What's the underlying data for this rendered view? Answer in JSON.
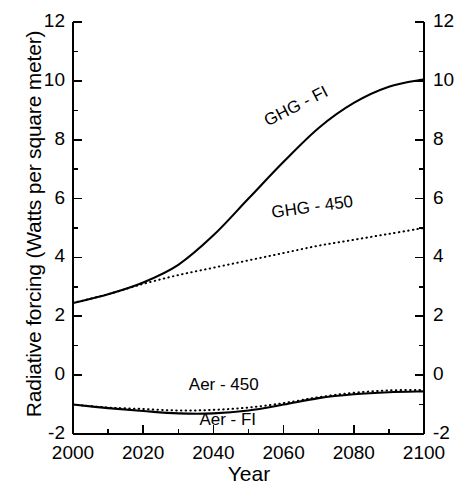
{
  "chart_data": {
    "type": "line",
    "title": "",
    "xlabel": "Year",
    "ylabel": "Radiative forcing (Watts per square meter)",
    "xlim": [
      2000,
      2100
    ],
    "ylim": [
      -2,
      12
    ],
    "xticks": [
      2000,
      2020,
      2040,
      2060,
      2080,
      2100
    ],
    "xtick_labels": [
      "2000",
      "2020",
      "2040",
      "2060",
      "2080",
      "2100"
    ],
    "xtick_minor_step": 10,
    "yticks": [
      -2,
      0,
      2,
      4,
      6,
      8,
      10,
      12
    ],
    "ytick_labels": [
      "-2",
      "0",
      "2",
      "4",
      "6",
      "8",
      "10",
      "12"
    ],
    "ytick_minor_step": 1,
    "grid": false,
    "legend_position": "inline-annotations",
    "mirrored_y_axis": true,
    "x": [
      2000,
      2010,
      2020,
      2030,
      2040,
      2050,
      2060,
      2070,
      2080,
      2090,
      2100
    ],
    "series": [
      {
        "name": "GHG - FI",
        "style": "solid",
        "color": "#000000",
        "values": [
          2.45,
          2.75,
          3.15,
          3.75,
          4.75,
          6.0,
          7.25,
          8.4,
          9.25,
          9.8,
          10.05
        ],
        "label": "GHG - FI",
        "label_x": 2056,
        "label_y": 8.35,
        "label_rotation": -27
      },
      {
        "name": "GHG - 450",
        "style": "dotted",
        "color": "#000000",
        "values": [
          2.45,
          2.75,
          3.1,
          3.4,
          3.65,
          3.9,
          4.15,
          4.4,
          4.6,
          4.8,
          5.0
        ],
        "label": "GHG - 450",
        "label_x": 2057,
        "label_y": 5.25,
        "label_rotation": -8
      },
      {
        "name": "Aer - 450",
        "style": "dotted",
        "color": "#000000",
        "values": [
          -1.0,
          -1.1,
          -1.15,
          -1.2,
          -1.18,
          -1.1,
          -0.95,
          -0.75,
          -0.6,
          -0.52,
          -0.5
        ],
        "label": "Aer - 450",
        "label_x": 2033,
        "label_y": -0.62,
        "label_rotation": 0
      },
      {
        "name": "Aer - FI",
        "style": "solid",
        "color": "#000000",
        "values": [
          -1.0,
          -1.12,
          -1.22,
          -1.3,
          -1.3,
          -1.2,
          -1.0,
          -0.78,
          -0.65,
          -0.58,
          -0.55
        ],
        "label": "Aer - FI",
        "label_x": 2036,
        "label_y": -1.78,
        "label_rotation": 0
      }
    ]
  }
}
